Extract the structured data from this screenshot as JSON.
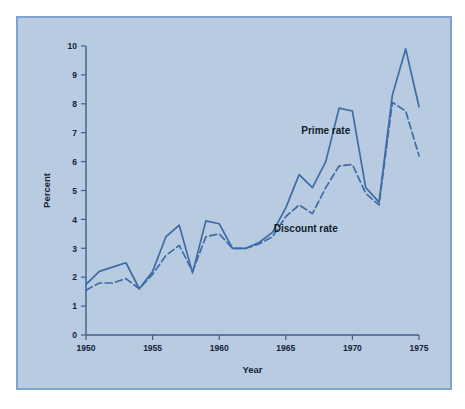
{
  "figure": {
    "background_color": "#ffffff",
    "panel_color": "#b8cbe0",
    "panel_border_color": "#7fa3cc",
    "line_color": "#3f6ca5",
    "axis_color": "#3a5f90",
    "text_color": "#14233a"
  },
  "chart_data": {
    "type": "line",
    "title": "",
    "xlabel": "Year",
    "ylabel": "Percent",
    "xlim": [
      1950,
      1975
    ],
    "ylim": [
      0,
      10
    ],
    "xticks": [
      1950,
      1955,
      1960,
      1965,
      1970,
      1975
    ],
    "xtick_labels": [
      "1950",
      "1955",
      "1960",
      "1965",
      "1970",
      "1975"
    ],
    "yticks": [
      0,
      1,
      2,
      3,
      4,
      5,
      6,
      7,
      8,
      9,
      10
    ],
    "ytick_labels": [
      "0",
      "1",
      "2",
      "3",
      "4",
      "5",
      "6",
      "7",
      "8",
      "9",
      "10"
    ],
    "grid": false,
    "legend_position": "inline-annotation",
    "x": [
      1950,
      1951,
      1952,
      1953,
      1954,
      1955,
      1956,
      1957,
      1958,
      1959,
      1960,
      1961,
      1962,
      1963,
      1964,
      1965,
      1966,
      1967,
      1968,
      1969,
      1970,
      1971,
      1972,
      1973,
      1974,
      1975
    ],
    "series": [
      {
        "name": "Prime rate",
        "style": "solid",
        "label": "Prime rate",
        "label_x": 1968.0,
        "label_y": 6.95,
        "values": [
          1.75,
          2.2,
          2.35,
          2.5,
          1.6,
          2.2,
          3.4,
          3.8,
          2.15,
          3.95,
          3.85,
          3.0,
          3.0,
          3.2,
          3.55,
          4.4,
          5.55,
          5.1,
          6.0,
          7.85,
          7.75,
          5.1,
          4.6,
          8.3,
          9.9,
          7.9
        ]
      },
      {
        "name": "Discount rate",
        "style": "dashed",
        "label": "Discount rate",
        "label_x": 1966.5,
        "label_y": 3.55,
        "values": [
          1.55,
          1.8,
          1.8,
          1.95,
          1.6,
          2.1,
          2.75,
          3.1,
          2.2,
          3.4,
          3.5,
          3.0,
          3.0,
          3.15,
          3.4,
          4.1,
          4.5,
          4.2,
          5.1,
          5.85,
          5.9,
          4.9,
          4.5,
          8.05,
          7.75,
          6.2
        ]
      }
    ]
  }
}
